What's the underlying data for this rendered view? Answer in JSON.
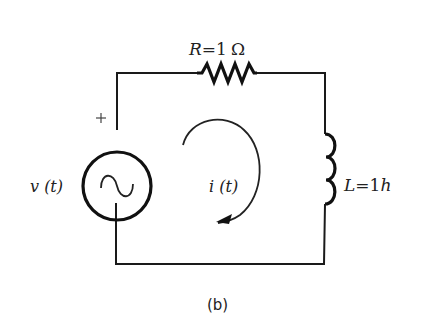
{
  "figure": {
    "caption": "(b)"
  },
  "components": {
    "source": {
      "type": "ac-voltage-source",
      "label": "v (t)",
      "polarity_label": "+",
      "symbol": "~"
    },
    "resistor": {
      "type": "resistor",
      "label_var": "R",
      "label_eq": "=",
      "label_val": "1",
      "label_unit": "Ω"
    },
    "inductor": {
      "type": "inductor",
      "label_var": "L",
      "label_eq": "=",
      "label_val": "1",
      "label_unit": "h"
    },
    "loop_current": {
      "label": "i (t)",
      "direction": "clockwise"
    }
  },
  "colors": {
    "background": "#ffffff",
    "ink": "#1a1a1a"
  }
}
